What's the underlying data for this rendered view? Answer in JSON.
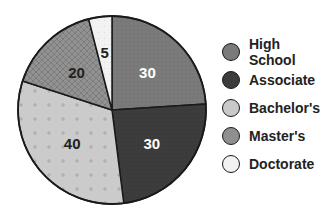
{
  "chart_data": {
    "type": "pie",
    "title": "",
    "categories": [
      "High School",
      "Associate",
      "Bachelor's",
      "Master's",
      "Doctorate"
    ],
    "values": [
      30,
      30,
      40,
      20,
      5
    ],
    "colors": [
      "#7a7a7a",
      "#3c3c3c",
      "#c9c9c9",
      "#8f8f8f",
      "#f2f2f2"
    ],
    "label_colors": [
      "#ffffff",
      "#ffffff",
      "#222222",
      "#222222",
      "#222222"
    ],
    "start_angle_deg": 0,
    "direction": "clockwise",
    "legend_position": "right",
    "data_labels": [
      "30",
      "30",
      "40",
      "20",
      "5"
    ]
  },
  "legend": {
    "items": [
      {
        "label": "High School",
        "color": "#7a7a7a"
      },
      {
        "label": "Associate",
        "color": "#3c3c3c"
      },
      {
        "label": "Bachelor's",
        "color": "#c9c9c9"
      },
      {
        "label": "Master's",
        "color": "#8f8f8f"
      },
      {
        "label": "Doctorate",
        "color": "#f2f2f2"
      }
    ]
  }
}
